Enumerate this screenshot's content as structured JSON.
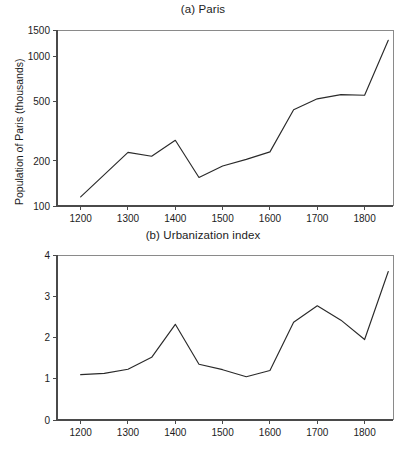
{
  "figure": {
    "background": "#ffffff",
    "line_color": "#2a2a2a",
    "axis_color": "#4a4a4a"
  },
  "panel_a": {
    "title": "(a) Paris",
    "ylabel": "Population of Paris (thousands)",
    "xtick_labels": [
      "1200",
      "1300",
      "1400",
      "1500",
      "1600",
      "1700",
      "1800"
    ],
    "ytick_labels": [
      "100",
      "200",
      "500",
      "1000",
      "1500"
    ]
  },
  "panel_b": {
    "title": "(b) Urbanization index",
    "ylabel": "Percent of population in the capital",
    "xtick_labels": [
      "1200",
      "1300",
      "1400",
      "1500",
      "1600",
      "1700",
      "1800"
    ],
    "ytick_labels": [
      "0",
      "1",
      "2",
      "3",
      "4"
    ]
  },
  "chart_data": [
    {
      "type": "line",
      "title": "(a) Paris",
      "xlabel": "",
      "ylabel": "Population of Paris (thousands)",
      "xlim": [
        1150,
        1860
      ],
      "ylim": [
        100,
        1500
      ],
      "yscale": "log",
      "xscale": "linear",
      "grid": false,
      "legend": "none",
      "xticks": [
        1200,
        1300,
        1400,
        1500,
        1600,
        1700,
        1800
      ],
      "yticks": [
        100,
        200,
        500,
        1000,
        1500
      ],
      "series": [
        {
          "name": "Population of Paris (thousands)",
          "x": [
            1200,
            1300,
            1350,
            1400,
            1450,
            1500,
            1550,
            1600,
            1650,
            1700,
            1750,
            1800,
            1850
          ],
          "values": [
            115,
            228,
            215,
            275,
            155,
            185,
            205,
            230,
            440,
            520,
            555,
            550,
            1280
          ]
        }
      ]
    },
    {
      "type": "line",
      "title": "(b) Urbanization index",
      "xlabel": "",
      "ylabel": "Percent of population in the capital",
      "xlim": [
        1150,
        1860
      ],
      "ylim": [
        0,
        4
      ],
      "yscale": "linear",
      "xscale": "linear",
      "grid": false,
      "legend": "none",
      "xticks": [
        1200,
        1300,
        1400,
        1500,
        1600,
        1700,
        1800
      ],
      "yticks": [
        0,
        1,
        2,
        3,
        4
      ],
      "series": [
        {
          "name": "Percent of population in the capital",
          "x": [
            1200,
            1250,
            1300,
            1350,
            1400,
            1450,
            1500,
            1550,
            1600,
            1650,
            1700,
            1750,
            1800,
            1850
          ],
          "values": [
            1.1,
            1.13,
            1.23,
            1.52,
            2.32,
            1.35,
            1.22,
            1.05,
            1.2,
            2.37,
            2.77,
            2.42,
            1.95,
            3.6
          ]
        }
      ]
    }
  ]
}
